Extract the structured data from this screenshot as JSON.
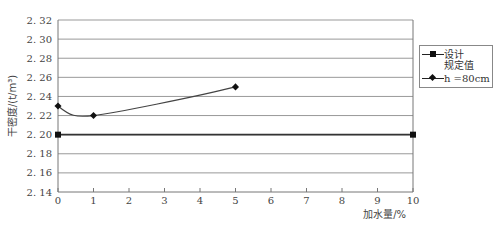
{
  "chart_data": {
    "type": "line",
    "title": "",
    "xlabel": "加水量/%",
    "ylabel": "干密度/(t/m³)",
    "xlim": [
      0,
      10
    ],
    "ylim": [
      2.14,
      2.32
    ],
    "x_ticks": [
      "0",
      "1",
      "2",
      "3",
      "4",
      "5",
      "6",
      "7",
      "8",
      "9",
      "10"
    ],
    "y_ticks": [
      "2.32",
      "2.30",
      "2.28",
      "2.26",
      "2.24",
      "2.22",
      "2.20",
      "2.18",
      "2.16",
      "2.14"
    ],
    "grid": "horizontal",
    "legend_position": "right",
    "series": [
      {
        "name": "设计规定值",
        "marker": "square",
        "x": [
          0,
          10
        ],
        "values": [
          2.2,
          2.2
        ]
      },
      {
        "name": "h=80cm",
        "marker": "diamond",
        "x": [
          0,
          1,
          5
        ],
        "values": [
          2.23,
          2.22,
          2.25
        ],
        "smooth": true
      }
    ]
  },
  "legend": {
    "items": [
      {
        "line1": "设计",
        "line2": "规定值"
      },
      {
        "line1": "h =80cm"
      }
    ]
  },
  "axes": {
    "ylabel_text": "干密度/(t/m³)",
    "xlabel_text": "加水量/%"
  }
}
